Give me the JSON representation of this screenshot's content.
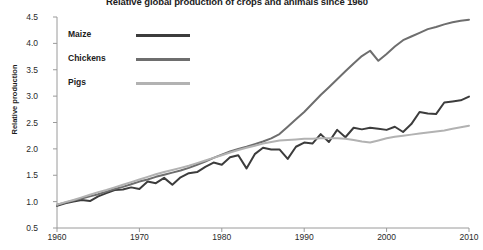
{
  "chart_data": {
    "type": "line",
    "title": "Relative global production of crops and animals since 1960",
    "xlabel": "",
    "ylabel": "Relative production",
    "xlim": [
      1960,
      2010
    ],
    "ylim": [
      0.5,
      4.5
    ],
    "xticks": [
      1960,
      1970,
      1980,
      1990,
      2000,
      2010
    ],
    "xtick_labels": [
      "1960",
      "1970",
      "1980",
      "1990",
      "2000",
      "2010"
    ],
    "yticks": [
      0.5,
      1.0,
      1.5,
      2.0,
      2.5,
      3.0,
      3.5,
      4.0,
      4.5
    ],
    "ytick_labels": [
      "0.5",
      "1.0",
      "1.5",
      "2.0",
      "2.5",
      "3.0",
      "3.5",
      "4.0",
      "4.5"
    ],
    "grid": false,
    "legend_position": "top-left",
    "x": [
      1960,
      1961,
      1962,
      1963,
      1964,
      1965,
      1966,
      1967,
      1968,
      1969,
      1970,
      1971,
      1972,
      1973,
      1974,
      1975,
      1976,
      1977,
      1978,
      1979,
      1980,
      1981,
      1982,
      1983,
      1984,
      1985,
      1986,
      1987,
      1988,
      1989,
      1990,
      1991,
      1992,
      1993,
      1994,
      1995,
      1996,
      1997,
      1998,
      1999,
      2000,
      2001,
      2002,
      2003,
      2004,
      2005,
      2006,
      2007,
      2008,
      2009,
      2010
    ],
    "series": [
      {
        "name": "Maize",
        "color": "#3c3c3c",
        "values": [
          0.92,
          0.97,
          1.0,
          1.03,
          1.01,
          1.1,
          1.16,
          1.22,
          1.23,
          1.27,
          1.24,
          1.38,
          1.35,
          1.45,
          1.32,
          1.46,
          1.54,
          1.56,
          1.66,
          1.74,
          1.7,
          1.84,
          1.88,
          1.63,
          1.9,
          2.02,
          1.99,
          1.99,
          1.81,
          2.04,
          2.12,
          2.1,
          2.28,
          2.13,
          2.36,
          2.22,
          2.4,
          2.37,
          2.4,
          2.38,
          2.36,
          2.42,
          2.32,
          2.47,
          2.7,
          2.67,
          2.66,
          2.88,
          2.9,
          2.92,
          2.99
        ]
      },
      {
        "name": "Chickens",
        "color": "#6e6e6e",
        "values": [
          0.94,
          0.98,
          1.02,
          1.06,
          1.1,
          1.14,
          1.19,
          1.24,
          1.28,
          1.33,
          1.38,
          1.42,
          1.47,
          1.51,
          1.55,
          1.59,
          1.64,
          1.7,
          1.76,
          1.83,
          1.89,
          1.95,
          2.0,
          2.04,
          2.09,
          2.14,
          2.2,
          2.28,
          2.42,
          2.56,
          2.7,
          2.86,
          3.02,
          3.17,
          3.32,
          3.47,
          3.62,
          3.76,
          3.86,
          3.67,
          3.8,
          3.94,
          4.06,
          4.13,
          4.2,
          4.27,
          4.31,
          4.36,
          4.4,
          4.43,
          4.45
        ]
      },
      {
        "name": "Pigs",
        "color": "#b2b2b2",
        "values": [
          0.94,
          0.99,
          1.03,
          1.08,
          1.13,
          1.18,
          1.22,
          1.27,
          1.32,
          1.37,
          1.42,
          1.47,
          1.52,
          1.56,
          1.6,
          1.64,
          1.68,
          1.73,
          1.78,
          1.83,
          1.88,
          1.93,
          1.98,
          2.02,
          2.06,
          2.1,
          2.13,
          2.16,
          2.17,
          2.18,
          2.19,
          2.19,
          2.2,
          2.2,
          2.2,
          2.19,
          2.17,
          2.14,
          2.12,
          2.16,
          2.2,
          2.23,
          2.25,
          2.27,
          2.29,
          2.31,
          2.33,
          2.35,
          2.38,
          2.41,
          2.44
        ]
      }
    ]
  }
}
